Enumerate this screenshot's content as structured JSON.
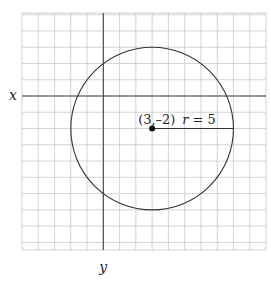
{
  "diagram": {
    "type": "coordinate-plane-circle",
    "axes": {
      "x_label": "x",
      "y_label": "y"
    },
    "grid": {
      "x_min": -5,
      "x_max": 10,
      "y_min": -11,
      "y_max": 5,
      "step": 1
    },
    "circle": {
      "center": {
        "x": 3,
        "y": -2
      },
      "radius": 5,
      "center_label": "(3,–2)",
      "radius_label_var": "r",
      "radius_label_eq": " = 5"
    }
  }
}
